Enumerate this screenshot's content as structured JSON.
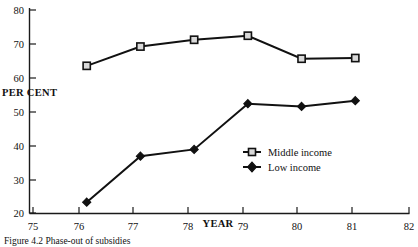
{
  "chart_data": {
    "type": "line",
    "title": "",
    "xlabel": "YEAR",
    "ylabel": "PER CENT",
    "xlim": [
      75,
      82
    ],
    "ylim": [
      20,
      80
    ],
    "grid": false,
    "legend_position": "center-right",
    "x": [
      76,
      77,
      78,
      79,
      80,
      81
    ],
    "xticks": [
      "75",
      "76",
      "77",
      "78",
      "79",
      "80",
      "81",
      "82"
    ],
    "yticks": [
      "20",
      "30",
      "40",
      "50",
      "60",
      "70",
      "80"
    ],
    "series": [
      {
        "name": "Middle income",
        "marker": "open-square",
        "values": [
          63.5,
          69.2,
          71.2,
          72.4,
          65.6,
          65.8
        ]
      },
      {
        "name": "Low income",
        "marker": "filled-diamond",
        "values": [
          23.2,
          36.8,
          38.8,
          52.3,
          51.5,
          53.2
        ]
      }
    ]
  },
  "axes": {
    "y_title": "PER CENT",
    "x_title": "YEAR"
  },
  "legend": {
    "entries": [
      {
        "label": "Middle income",
        "marker": "open-square"
      },
      {
        "label": "Low income",
        "marker": "filled-diamond"
      }
    ]
  },
  "caption": {
    "text": "Figure 4.2  Phase-out of subsidies"
  },
  "colors": {
    "ink": "#111111",
    "marker_fill": "#d9d9d9",
    "background": "#ffffff"
  }
}
